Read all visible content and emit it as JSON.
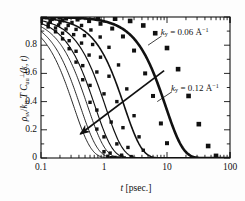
{
  "chart_data": {
    "type": "line",
    "title": "",
    "xlabel": "t [psec.]",
    "ylabel": "rho_sv / k_B T  C_uu^perp(k, t)",
    "xscale": "log",
    "yscale": "linear",
    "xlim": [
      0.1,
      100
    ],
    "ylim": [
      0,
      1.0
    ],
    "grid": false,
    "legend": "none",
    "xticks": [
      0.1,
      1,
      10,
      100
    ],
    "xtick_labels": [
      "0.1",
      "1",
      "10",
      "100"
    ],
    "yticks": [
      0,
      0.2,
      0.4,
      0.6,
      0.8
    ],
    "ytick_labels": [
      "0",
      "0.2",
      "0.4",
      "0.6",
      "0.8"
    ],
    "marker": "square",
    "series": [
      {
        "name": "ky = 0.12",
        "ky": 0.12,
        "tau": 0.33,
        "beta": 1.55,
        "lw": 0.9,
        "markers": true,
        "x": [
          0.1,
          0.13,
          0.17,
          0.22,
          0.28,
          0.36,
          0.46,
          0.6,
          0.77,
          1.0,
          1.15,
          1.3,
          1.45
        ],
        "y": [
          0.955,
          0.93,
          0.895,
          0.845,
          0.775,
          0.68,
          0.555,
          0.395,
          0.205,
          0.045,
          0.012,
          0.002,
          0.0
        ]
      },
      {
        "name": "ky = 0.11",
        "ky": 0.11,
        "tau": 0.42,
        "beta": 1.55,
        "lw": 0.9,
        "markers": true,
        "x": [
          0.1,
          0.13,
          0.17,
          0.22,
          0.28,
          0.36,
          0.46,
          0.6,
          0.77,
          1.0,
          1.25,
          1.5,
          1.7
        ],
        "y": [
          0.965,
          0.948,
          0.922,
          0.885,
          0.832,
          0.757,
          0.655,
          0.515,
          0.34,
          0.15,
          0.035,
          0.004,
          0.0
        ]
      },
      {
        "name": "ky = 0.10",
        "ky": 0.1,
        "tau": 0.55,
        "beta": 1.55,
        "lw": 0.9,
        "markers": true,
        "x": [
          0.1,
          0.14,
          0.19,
          0.25,
          0.33,
          0.44,
          0.58,
          0.77,
          1.0,
          1.3,
          1.6,
          1.9,
          2.1
        ],
        "y": [
          0.975,
          0.962,
          0.943,
          0.915,
          0.875,
          0.815,
          0.73,
          0.61,
          0.455,
          0.255,
          0.1,
          0.02,
          0.0
        ]
      },
      {
        "name": "ky = 0.09",
        "ky": 0.09,
        "tau": 0.72,
        "beta": 1.55,
        "lw": 1.1,
        "markers": true,
        "x": [
          0.1,
          0.14,
          0.2,
          0.27,
          0.36,
          0.49,
          0.66,
          0.88,
          1.2,
          1.6,
          2.0,
          2.4,
          2.7
        ],
        "y": [
          0.982,
          0.973,
          0.96,
          0.94,
          0.912,
          0.868,
          0.805,
          0.715,
          0.58,
          0.4,
          0.215,
          0.075,
          0.01
        ]
      },
      {
        "name": "ky = 0.08",
        "ky": 0.08,
        "tau": 1.05,
        "beta": 1.55,
        "lw": 1.2,
        "markers": true,
        "x": [
          0.1,
          0.15,
          0.22,
          0.31,
          0.44,
          0.62,
          0.87,
          1.2,
          1.7,
          2.3,
          3.0,
          3.6,
          4.2
        ],
        "y": [
          0.989,
          0.983,
          0.974,
          0.961,
          0.94,
          0.908,
          0.858,
          0.785,
          0.66,
          0.49,
          0.3,
          0.15,
          0.055
        ]
      },
      {
        "name": "ky = 0.07",
        "ky": 0.07,
        "tau": 2.1,
        "beta": 1.55,
        "lw": 1.6,
        "markers": true,
        "x": [
          0.1,
          0.16,
          0.25,
          0.38,
          0.58,
          0.88,
          1.35,
          2.0,
          3.0,
          4.5,
          6.0,
          8.0,
          10.0
        ],
        "y": [
          0.996,
          0.993,
          0.989,
          0.982,
          0.971,
          0.952,
          0.918,
          0.862,
          0.762,
          0.6,
          0.44,
          0.245,
          0.105
        ]
      },
      {
        "name": "ky = 0.06",
        "ky": 0.06,
        "tau": 9.5,
        "beta": 1.55,
        "lw": 2.6,
        "markers": true,
        "x": [
          0.1,
          0.2,
          0.4,
          0.8,
          1.5,
          2.6,
          4.2,
          6.5,
          10,
          15,
          22,
          32,
          45,
          60
        ],
        "y": [
          0.9995,
          0.999,
          0.998,
          0.995,
          0.988,
          0.972,
          0.94,
          0.885,
          0.78,
          0.63,
          0.44,
          0.24,
          0.085,
          0.015
        ]
      }
    ],
    "annotations": [
      {
        "id": "ann-ky-006",
        "text": "ky = 0.06 A^-1",
        "x": 8.0,
        "y": 0.88
      },
      {
        "id": "ann-ky-012",
        "text": "ky = 0.12 A^-1",
        "x": 13.0,
        "y": 0.5
      },
      {
        "id": "arrow-increasing-ky",
        "text": "",
        "from": [
          9.0,
          0.62
        ],
        "to": [
          0.42,
          0.17
        ]
      }
    ]
  },
  "axes": {
    "ytick_labels": [
      "0.8",
      "0.6",
      "0.4",
      "0.2",
      "0"
    ],
    "xtick_labels": [
      "0.1",
      "1",
      "10",
      "100"
    ],
    "xlabel_parts": {
      "var": "t",
      "unit": "[psec.]"
    },
    "ylabel_parts": {
      "rho": "ρ",
      "sv": "sv",
      "slash": "/",
      "k": "k",
      "B": "B",
      "T": "T",
      "C": "C",
      "uu": "uu",
      "perp": "⊥",
      "arg": "(k, t)"
    }
  },
  "annotations_text": {
    "ky_006": {
      "k": "k",
      "sub": "y",
      "eq": "= 0.06 Å",
      "sup": "−1"
    },
    "ky_012": {
      "k": "k",
      "sub": "y",
      "eq": "= 0.12 Å",
      "sup": "−1"
    }
  }
}
